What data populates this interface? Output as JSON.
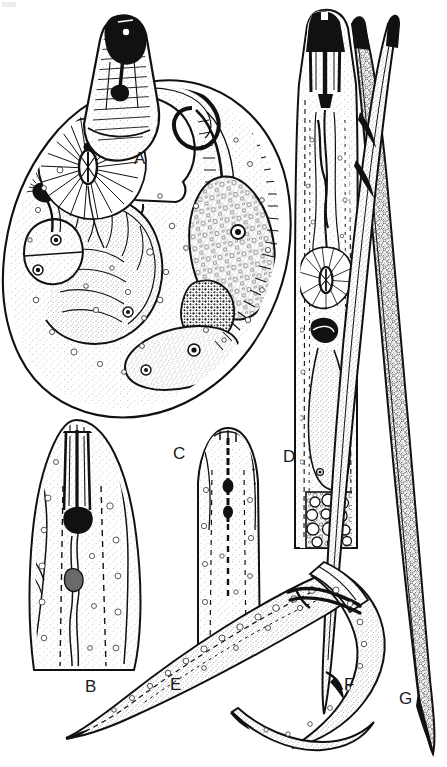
{
  "figure": {
    "kind": "scientific-line-drawing-plate",
    "background_color": "#ffffff",
    "ink_color": "#111111",
    "width_px": 447,
    "height_px": 767
  },
  "labels": [
    {
      "id": "A",
      "text": "A",
      "x": 134,
      "y": 150,
      "panel": "female-body-whole-mount"
    },
    {
      "id": "B",
      "text": "B",
      "x": 85,
      "y": 678,
      "panel": "anterior-head-stylet-detail"
    },
    {
      "id": "C",
      "text": "C",
      "x": 173,
      "y": 445,
      "panel": "head-end-lateral"
    },
    {
      "id": "D",
      "text": "D",
      "x": 283,
      "y": 448,
      "panel": "anterior-esophageal-region"
    },
    {
      "id": "E",
      "text": "E",
      "x": 170,
      "y": 676,
      "panel": "male-posterior-tail"
    },
    {
      "id": "F",
      "text": "F",
      "x": 344,
      "y": 676,
      "panel": "male-tail-spicules"
    },
    {
      "id": "G",
      "text": "G",
      "x": 399,
      "y": 690,
      "panel": "juvenile-tail-tip"
    }
  ],
  "panels": [
    {
      "id": "A",
      "name": "female-body-whole-mount",
      "caption_letter": "A",
      "features": [
        "saccate swollen female body",
        "protruding neck with stylet",
        "median esophageal bulb with radiating musculature",
        "dorsal esophageal gland nucleus",
        "subventral gland lobes",
        "large ovoid germinal cells with nucleoli",
        "granular intestinal mass",
        "annulated cuticle margin"
      ],
      "bbox": {
        "x": 8,
        "y": 12,
        "w": 280,
        "h": 405
      }
    },
    {
      "id": "B",
      "name": "anterior-head-stylet-detail",
      "caption_letter": "B",
      "features": [
        "cephalic framework",
        "stylet with basal knobs",
        "procorpus lumen",
        "dorsal gland orifice",
        "lateral field lines",
        "annulated cuticle"
      ],
      "bbox": {
        "x": 22,
        "y": 418,
        "w": 130,
        "h": 250
      }
    },
    {
      "id": "C",
      "name": "head-end-lateral",
      "caption_letter": "C",
      "features": [
        "rounded lip region",
        "slender stylet with knobs",
        "esophageal lumen",
        "lateral incisures"
      ],
      "bbox": {
        "x": 190,
        "y": 425,
        "w": 82,
        "h": 225
      }
    },
    {
      "id": "D",
      "name": "anterior-esophageal-region",
      "caption_letter": "D",
      "features": [
        "heavily sclerotized stylet",
        "procorpus",
        "metacorpus with valve plates",
        "esophago-intestinal junction",
        "overlapping gland lobe with nuclei",
        "intestinal cells with large globules"
      ],
      "bbox": {
        "x": 293,
        "y": 8,
        "w": 72,
        "h": 540
      }
    },
    {
      "id": "E",
      "name": "male-posterior-tail",
      "caption_letter": "E",
      "features": [
        "elongate tapering tail",
        "lateral field striations",
        "finely pointed terminus"
      ],
      "bbox": {
        "x": 20,
        "y": 580,
        "w": 330,
        "h": 160
      }
    },
    {
      "id": "F",
      "name": "male-tail-spicules",
      "caption_letter": "F",
      "features": [
        "paired arcuate spicules",
        "gubernaculum",
        "cloacal opening",
        "caudal alae margin"
      ],
      "bbox": {
        "x": 230,
        "y": 555,
        "w": 160,
        "h": 200
      }
    },
    {
      "id": "G",
      "name": "juvenile-tail-tip",
      "caption_letter": "G",
      "features": [
        "slender vermiform body",
        "dense granular intestine",
        "hyaline tail terminus"
      ],
      "bbox": {
        "x": 352,
        "y": 30,
        "w": 90,
        "h": 730
      }
    }
  ]
}
